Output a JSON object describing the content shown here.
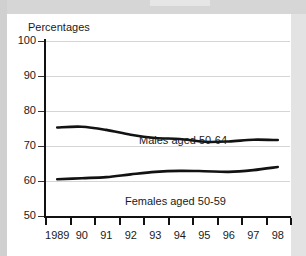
{
  "chart_data": {
    "type": "line",
    "title": "Percentages",
    "xlabel": "",
    "ylabel": "Percentages",
    "ylim": [
      50,
      100
    ],
    "yticks": [
      50,
      60,
      70,
      80,
      90,
      100
    ],
    "grid": true,
    "legend_position": "inline-labels",
    "x": [
      "1989",
      "90",
      "91",
      "92",
      "93",
      "94",
      "95",
      "96",
      "97",
      "98"
    ],
    "xtick_labels": [
      "1989",
      "90",
      "91",
      "92",
      "93",
      "94",
      "95",
      "96",
      "97",
      "98"
    ],
    "series": [
      {
        "name": "Males aged 50-64",
        "values": [
          75.3,
          75.5,
          74.6,
          73.2,
          72.3,
          72.0,
          71.2,
          71.3,
          71.8,
          71.7
        ]
      },
      {
        "name": "Females aged 50-59",
        "values": [
          60.5,
          60.8,
          61.1,
          61.9,
          62.6,
          62.9,
          62.8,
          62.6,
          63.1,
          64.0
        ]
      }
    ],
    "annotations": [
      {
        "text": "Males aged 50-64",
        "x": "93",
        "y": 75.5
      },
      {
        "text": "Females aged 50-59",
        "x": "93",
        "y": 58.8
      }
    ]
  },
  "colors": {
    "line": "#121212",
    "grid": "#d5d5d5",
    "axis": "#111111",
    "text": "#1a1a1a",
    "card_background": "#ffffff",
    "page_background": "#d9d9d9"
  }
}
